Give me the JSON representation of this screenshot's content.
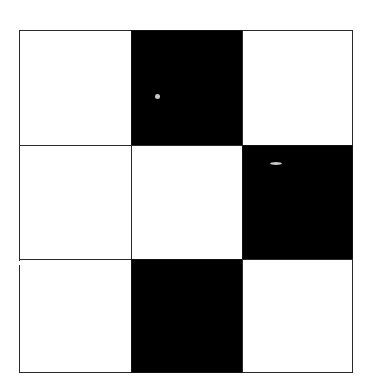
{
  "figure": {
    "type": "grid-pattern",
    "rows": 3,
    "cols": 3,
    "colors": {
      "filled": "#000000",
      "empty": "#ffffff",
      "line": "#2a2a2a"
    },
    "frame": {
      "left": 19,
      "top": 30,
      "right": 352,
      "bottom": 372
    },
    "col_edges": [
      19,
      131,
      242,
      352
    ],
    "row_edges": [
      30,
      145,
      259,
      372
    ],
    "cells": [
      [
        "white",
        "black",
        "white"
      ],
      [
        "white",
        "white",
        "black"
      ],
      [
        "white",
        "black",
        "white"
      ]
    ],
    "artifacts": [
      {
        "x": 155,
        "y": 94,
        "w": 5,
        "h": 5
      },
      {
        "x": 270,
        "y": 162,
        "w": 12,
        "h": 3
      }
    ]
  }
}
